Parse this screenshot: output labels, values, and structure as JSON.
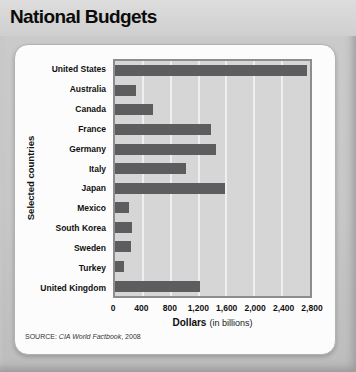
{
  "header": {
    "title": "National Budgets"
  },
  "chart_data": {
    "type": "bar",
    "orientation": "horizontal",
    "title": "National Budgets",
    "categories": [
      "United States",
      "Australia",
      "Canada",
      "France",
      "Germany",
      "Italy",
      "Japan",
      "Mexico",
      "South Korea",
      "Sweden",
      "Turkey",
      "United Kingdom"
    ],
    "values": [
      2750,
      300,
      550,
      1375,
      1450,
      1025,
      1575,
      200,
      250,
      230,
      125,
      1225
    ],
    "ylabel": "Selected countries",
    "xlabel": "Dollars",
    "xlabel_note": "(in billions)",
    "xlim": [
      0,
      2800
    ],
    "xticks": [
      0,
      400,
      800,
      1200,
      1600,
      2000,
      2400,
      2800
    ],
    "xtick_labels": [
      "0",
      "400",
      "800",
      "1,200",
      "1,600",
      "2,000",
      "2,400",
      "2,800"
    ],
    "grid": true,
    "legend": "none",
    "bar_color": "#5d5d5f",
    "plot_bg": "#d6d6d6"
  },
  "source": {
    "prefix": "SOURCE: ",
    "work": "CIA World Factbook",
    "suffix": ", 2008"
  }
}
